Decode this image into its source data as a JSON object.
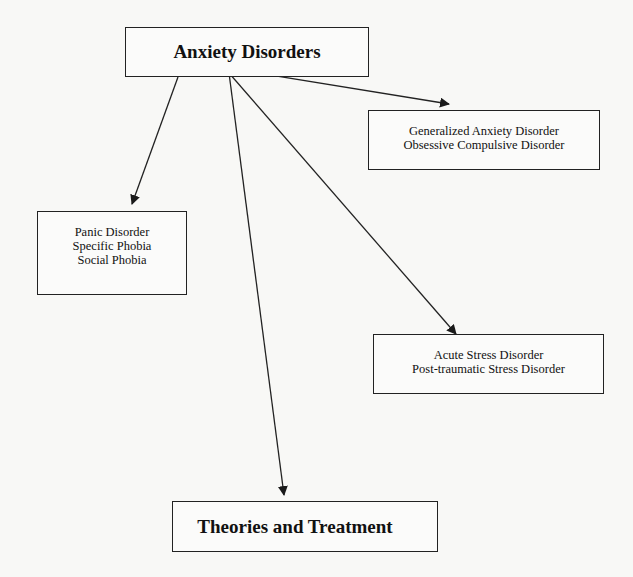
{
  "diagram": {
    "root": {
      "label": "Anxiety Disorders"
    },
    "nodes": [
      {
        "id": "gad",
        "lines": [
          "Generalized Anxiety Disorder",
          "Obsessive Compulsive Disorder"
        ]
      },
      {
        "id": "panic",
        "lines": [
          "Panic Disorder",
          "Specific Phobia",
          "Social Phobia"
        ]
      },
      {
        "id": "stress",
        "lines": [
          "Acute Stress Disorder",
          "Post-traumatic Stress Disorder"
        ]
      }
    ],
    "bottom": {
      "label": "Theories and Treatment"
    },
    "edges": [
      {
        "from": "Anxiety Disorders",
        "to": "Generalized Anxiety Disorder / Obsessive Compulsive Disorder"
      },
      {
        "from": "Anxiety Disorders",
        "to": "Panic Disorder / Specific Phobia / Social Phobia"
      },
      {
        "from": "Anxiety Disorders",
        "to": "Acute Stress Disorder / Post-traumatic Stress Disorder"
      },
      {
        "from": "Anxiety Disorders",
        "to": "Theories and Treatment"
      }
    ],
    "colors": {
      "background": "#f8f8f6",
      "stroke": "#222222",
      "text": "#111111"
    }
  }
}
